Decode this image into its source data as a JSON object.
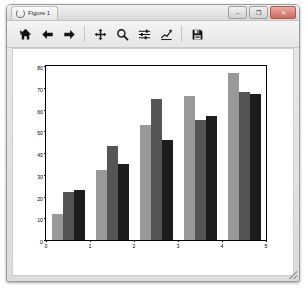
{
  "window": {
    "title": "Figure 1",
    "title_icon": "figure-icon",
    "controls": [
      {
        "name": "minimize-button",
        "glyph": "–"
      },
      {
        "name": "maximize-button",
        "glyph": "❐"
      },
      {
        "name": "close-button",
        "glyph": "✕"
      }
    ]
  },
  "toolbar": {
    "buttons": [
      {
        "name": "home-button",
        "icon": "home-icon",
        "tooltip": "Reset original view"
      },
      {
        "name": "back-button",
        "icon": "arrow-left-icon",
        "tooltip": "Back to previous view"
      },
      {
        "name": "forward-button",
        "icon": "arrow-right-icon",
        "tooltip": "Forward to next view"
      },
      {
        "name": "pan-button",
        "icon": "move-cross-icon",
        "tooltip": "Pan axes with left mouse, zoom with right"
      },
      {
        "name": "zoom-button",
        "icon": "magnifier-icon",
        "tooltip": "Zoom to rectangle"
      },
      {
        "name": "configure-subplots-button",
        "icon": "sliders-icon",
        "tooltip": "Configure subplots"
      },
      {
        "name": "edit-axis-button",
        "icon": "line-chart-icon",
        "tooltip": "Edit axis, curve and image parameters"
      },
      {
        "name": "save-button",
        "icon": "floppy-disk-icon",
        "tooltip": "Save the figure"
      }
    ]
  },
  "chart_data": {
    "type": "bar",
    "title": "",
    "xlabel": "",
    "ylabel": "",
    "categories": [
      "0",
      "1",
      "2",
      "3",
      "4"
    ],
    "xticklabels": [
      "0",
      "1",
      "2",
      "3",
      "4",
      "5"
    ],
    "yticklabels": [
      "0",
      "10",
      "20",
      "30",
      "40",
      "50",
      "60",
      "70",
      "80"
    ],
    "xlim": [
      0,
      5
    ],
    "ylim": [
      0,
      80
    ],
    "grid": false,
    "legend": false,
    "bar_width": 0.25,
    "series": [
      {
        "name": "series-1",
        "color": "#999999",
        "values": [
          12,
          32,
          53,
          66,
          77
        ]
      },
      {
        "name": "series-2",
        "color": "#555555",
        "values": [
          22,
          43,
          65,
          55,
          68
        ]
      },
      {
        "name": "series-3",
        "color": "#1c1c1c",
        "values": [
          23,
          35,
          46,
          57,
          67
        ]
      }
    ]
  }
}
